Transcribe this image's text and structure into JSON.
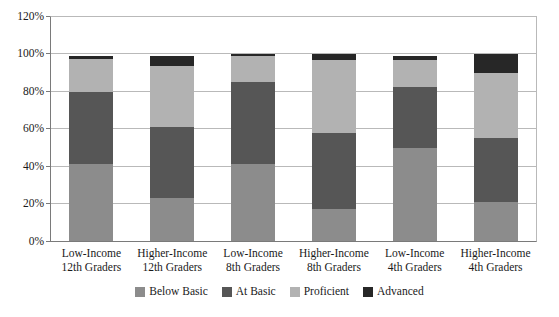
{
  "chart_data": {
    "type": "bar",
    "subtype": "stacked-bar-100",
    "title": "",
    "xlabel": "",
    "ylabel": "",
    "ylim": [
      0,
      120
    ],
    "ytick_labels": [
      "0%",
      "20%",
      "40%",
      "60%",
      "80%",
      "100%",
      "120%"
    ],
    "ytick_values": [
      0,
      20,
      40,
      60,
      80,
      100,
      120
    ],
    "grid": true,
    "legend_position": "bottom-center",
    "categories": [
      "Low-Income\n12th Graders",
      "Higher-Income\n12th Graders",
      "Low-Income\n8th Graders",
      "Higher-Income\n8th Graders",
      "Low-Income\n4th Graders",
      "Higher-Income\n4th Graders"
    ],
    "category_lines": [
      [
        "Low-Income",
        "12th Graders"
      ],
      [
        "Higher-Income",
        "12th Graders"
      ],
      [
        "Low-Income",
        "8th Graders"
      ],
      [
        "Higher-Income",
        "8th Graders"
      ],
      [
        "Low-Income",
        "4th Graders"
      ],
      [
        "Higher-Income",
        "4th Graders"
      ]
    ],
    "series": [
      {
        "name": "Below Basic",
        "color": "#8c8c8c",
        "values": [
          41,
          23,
          41,
          17,
          50,
          21
        ]
      },
      {
        "name": "At Basic",
        "color": "#565656",
        "values": [
          39,
          38,
          44,
          41,
          32.5,
          34
        ]
      },
      {
        "name": "Proficient",
        "color": "#b2b2b2",
        "values": [
          17.5,
          33,
          14,
          39,
          14.5,
          35
        ]
      },
      {
        "name": "Advanced",
        "color": "#272727",
        "values": [
          1.5,
          5,
          1,
          3,
          2,
          10
        ]
      }
    ],
    "stack_tops": [
      99,
      99,
      100,
      100,
      99,
      100
    ]
  },
  "legend": {
    "items": [
      {
        "label": "Below Basic",
        "color": "#8c8c8c"
      },
      {
        "label": "At Basic",
        "color": "#565656"
      },
      {
        "label": "Proficient",
        "color": "#b2b2b2"
      },
      {
        "label": "Advanced",
        "color": "#272727"
      }
    ]
  }
}
